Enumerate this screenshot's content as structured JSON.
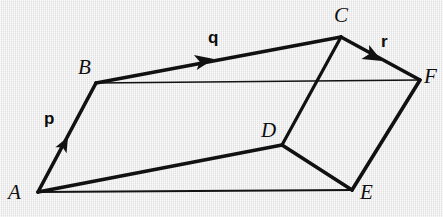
{
  "figure": {
    "background_color": "#ededed",
    "ink_color": "#111111",
    "width": 443,
    "height": 217
  },
  "vertices": [
    {
      "id": "A",
      "label": "A",
      "x": 38,
      "y": 192,
      "label_x": 8,
      "label_y": 182
    },
    {
      "id": "B",
      "label": "B",
      "x": 96,
      "y": 83,
      "label_x": 78,
      "label_y": 57
    },
    {
      "id": "C",
      "label": "C",
      "x": 341,
      "y": 37,
      "label_x": 334,
      "label_y": 5
    },
    {
      "id": "D",
      "label": "D",
      "x": 282,
      "y": 145,
      "label_x": 261,
      "label_y": 120
    },
    {
      "id": "E",
      "label": "E",
      "x": 352,
      "y": 190,
      "label_x": 360,
      "label_y": 182
    },
    {
      "id": "F",
      "label": "F",
      "x": 420,
      "y": 80,
      "label_x": 424,
      "label_y": 66
    }
  ],
  "edges": [
    {
      "id": "AB",
      "from": "A",
      "to": "B",
      "weight": "thick",
      "hidden": false
    },
    {
      "id": "BC",
      "from": "B",
      "to": "C",
      "weight": "thick",
      "hidden": false
    },
    {
      "id": "CF",
      "from": "C",
      "to": "F",
      "weight": "thick",
      "hidden": false
    },
    {
      "id": "BF",
      "from": "B",
      "to": "F",
      "weight": "thin",
      "hidden": true
    },
    {
      "id": "CD",
      "from": "C",
      "to": "D",
      "weight": "medium",
      "hidden": false
    },
    {
      "id": "AD",
      "from": "A",
      "to": "D",
      "weight": "thick",
      "hidden": false
    },
    {
      "id": "DE",
      "from": "D",
      "to": "E",
      "weight": "thick",
      "hidden": false
    },
    {
      "id": "AE",
      "from": "A",
      "to": "E",
      "weight": "thin",
      "hidden": true
    },
    {
      "id": "EF",
      "from": "E",
      "to": "F",
      "weight": "thick",
      "hidden": false
    }
  ],
  "vectors": [
    {
      "id": "p",
      "label": "p",
      "on_edge": "AB",
      "arrow_x": 68,
      "arrow_y": 137,
      "angle_deg": -62,
      "label_x": 44,
      "label_y": 110
    },
    {
      "id": "q",
      "label": "q",
      "on_edge": "BC",
      "arrow_x": 212,
      "arrow_y": 60,
      "angle_deg": -10.6,
      "label_x": 208,
      "label_y": 29
    },
    {
      "id": "r",
      "label": "r",
      "on_edge": "CF",
      "arrow_x": 378,
      "arrow_y": 58,
      "angle_deg": 29.5,
      "label_x": 381,
      "label_y": 33
    }
  ]
}
